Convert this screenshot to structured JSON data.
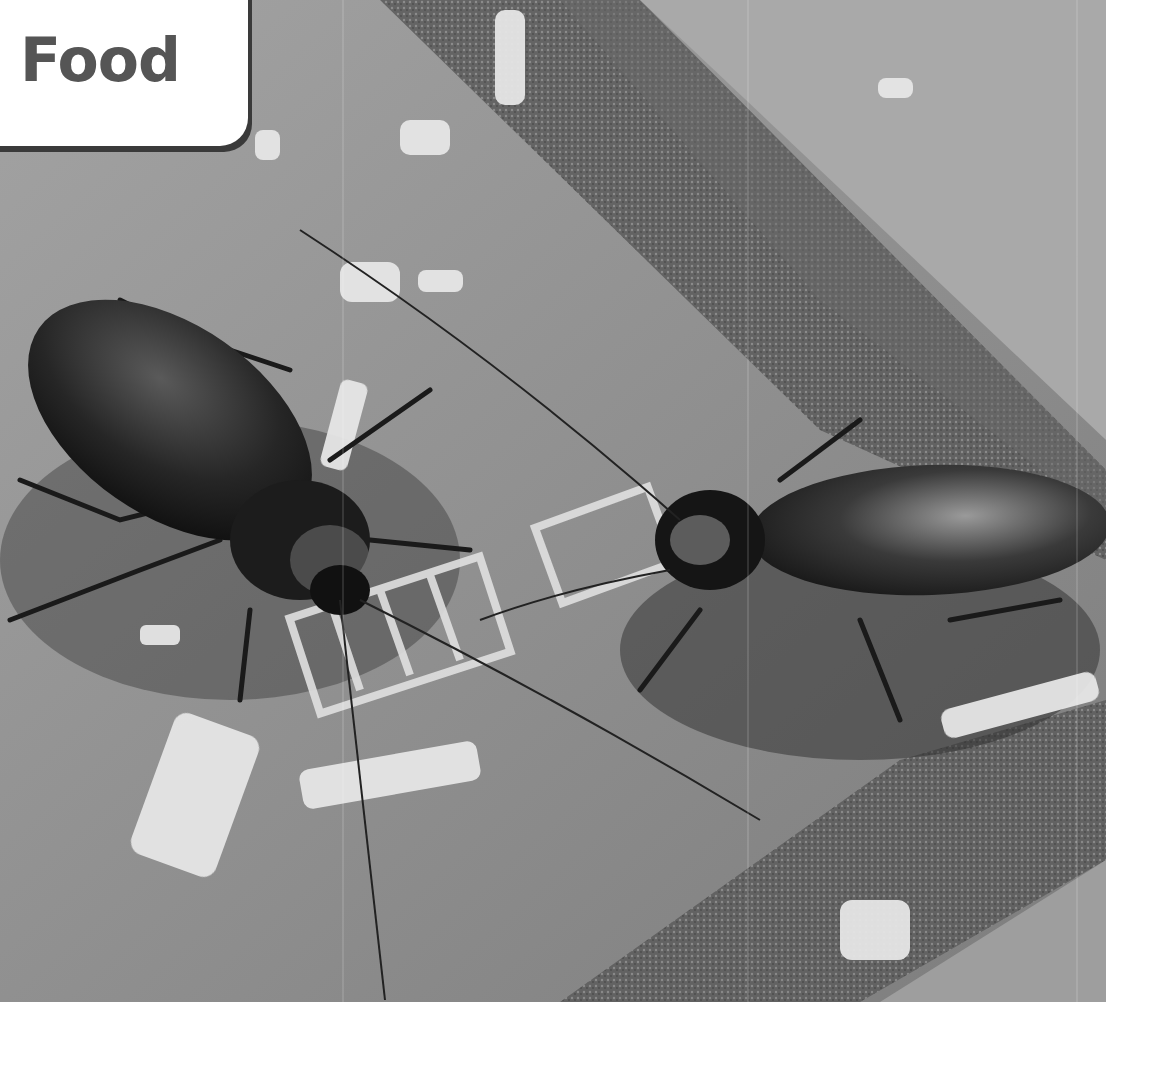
{
  "label": {
    "text": "Food"
  },
  "photo": {
    "subject": "two cockroaches eating food crumbs on a tile floor",
    "tone": "grayscale"
  }
}
